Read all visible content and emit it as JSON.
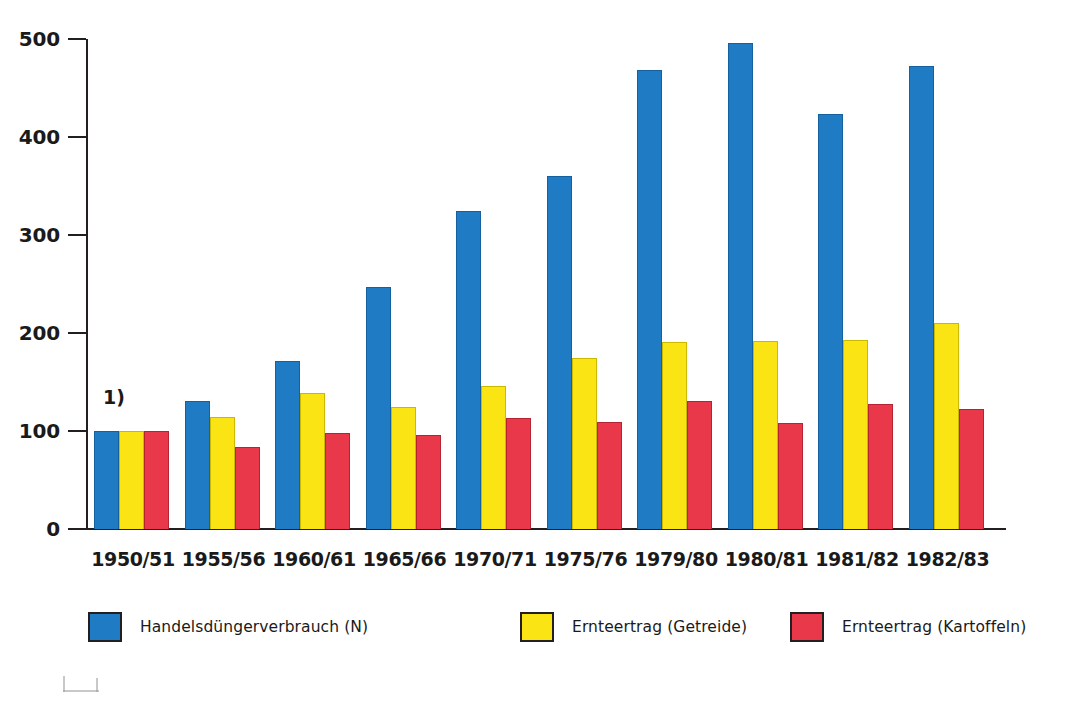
{
  "chart_data": {
    "type": "bar",
    "title": "",
    "subtitle": "",
    "xlabel": "",
    "ylabel": "",
    "ylim": [
      0,
      500
    ],
    "yticks": [
      0,
      100,
      200,
      300,
      400,
      500
    ],
    "grid": false,
    "legend_position": "bottom",
    "index_note": "1)",
    "categories": [
      "1950/51",
      "1955/56",
      "1960/61",
      "1965/66",
      "1970/71",
      "1975/76",
      "1979/80",
      "1980/81",
      "1981/82",
      "1982/83"
    ],
    "series": [
      {
        "name": "Handelsdüngerverbrauch (N)",
        "color": "#1f7bc4",
        "values": [
          100,
          131,
          171,
          247,
          325,
          360,
          468,
          496,
          423,
          472
        ]
      },
      {
        "name": "Ernteertrag (Getreide)",
        "color": "#fbe414",
        "values": [
          100,
          114,
          139,
          124,
          146,
          175,
          191,
          192,
          193,
          210
        ]
      },
      {
        "name": "Ernteertrag (Kartoffeln)",
        "color": "#e8384a",
        "values": [
          100,
          84,
          98,
          96,
          113,
          109,
          131,
          108,
          128,
          122
        ]
      }
    ]
  },
  "axis": {
    "y_tick_labels": [
      "500",
      "400",
      "300",
      "200",
      "100",
      "0"
    ]
  },
  "legend": {
    "items": [
      {
        "label": "Handelsdüngerverbrauch (N)",
        "color": "#1f7bc4",
        "swatch": "blue"
      },
      {
        "label": "Ernteertrag (Getreide)",
        "color": "#fbe414",
        "swatch": "yellow"
      },
      {
        "label": "Ernteertrag (Kartoffeln)",
        "color": "#e8384a",
        "swatch": "red"
      }
    ]
  },
  "footnote": {
    "marker": "1)"
  }
}
